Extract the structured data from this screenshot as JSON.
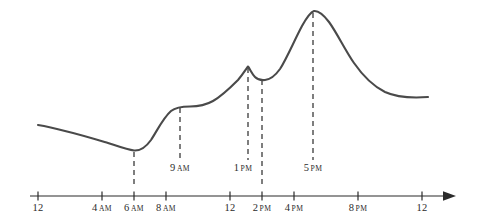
{
  "chart_data": {
    "type": "line",
    "title": "",
    "subtitle": "",
    "xlabel": "",
    "ylabel": "",
    "grid": false,
    "legend": "none",
    "x_axis": {
      "type": "time-of-day",
      "range_hours": [
        0,
        24
      ],
      "arrow_end": true,
      "tick_labels": [
        "12",
        "4 AM",
        "6 AM",
        "8 AM",
        "12",
        "2 PM",
        "4 PM",
        "8 PM",
        "12"
      ],
      "tick_hours": [
        0,
        4,
        6,
        8,
        12,
        14,
        16,
        20,
        24
      ]
    },
    "y_axis": {
      "visible": false,
      "ylim": [
        0,
        100
      ]
    },
    "markers": [
      {
        "label": "",
        "hour": 6,
        "labelled": false
      },
      {
        "label": "9 AM",
        "hour": 9,
        "labelled": true
      },
      {
        "label": "1 PM",
        "hour": 13,
        "labelled": true
      },
      {
        "label": "",
        "hour": 14,
        "labelled": false
      },
      {
        "label": "5 PM",
        "hour": 17,
        "labelled": true
      }
    ],
    "series": [
      {
        "name": "value",
        "x_hours": [
          0.0,
          1.5,
          3.0,
          4.5,
          6.0,
          6.8,
          7.6,
          8.4,
          9.0,
          10.0,
          11.0,
          12.0,
          12.6,
          13.0,
          13.5,
          14.0,
          14.6,
          15.4,
          16.2,
          17.0,
          18.0,
          19.2,
          20.6,
          22.0,
          23.4,
          24.4
        ],
        "values": [
          23,
          20,
          17,
          15,
          13,
          16,
          26,
          34,
          36,
          37,
          40,
          47,
          57,
          69,
          62,
          60,
          61,
          72,
          88,
          96,
          93,
          83,
          68,
          55,
          48,
          45
        ]
      }
    ]
  },
  "geometry": {
    "axis_y": 196,
    "axis_x_start": 30,
    "axis_x_end": 455,
    "x_for_hour_0": 38,
    "px_per_hour": 16,
    "curve_color": "#4a4a4a",
    "axis_color": "#2b2b2b",
    "dash_color": "#3a3a3a",
    "background": "#ffffff",
    "curve_path": "M 38 125 C 62 129, 88 137, 108 143 C 120 147, 128 150, 134 150.5 C 140 151, 146 147, 151 140 C 157 131, 163 118, 171 111 C 176 107, 182 106.5, 190 106.5 C 198 106.5, 206 105, 213 101 C 222 96, 230 88, 238 80 C 243 74, 246 69, 248 66.5 C 250 69, 252 74, 255 77 C 258 80, 261 80.5, 265 80 C 270 79.5, 275 76, 280 69 C 287 58, 294 41, 302 26 C 307 17, 311 12, 314 11 C 318 10.5, 323 14, 329 22 C 337 33, 345 50, 354 63 C 363 76, 373 86, 385 92 C 398 98, 414 98, 428 97",
    "marker_lines": [
      {
        "x": 134,
        "y_top": 152,
        "y_bottom": 186
      },
      {
        "x": 180,
        "y_top": 108,
        "y_bottom": 160
      },
      {
        "x": 248,
        "y_top": 68,
        "y_bottom": 160
      },
      {
        "x": 262,
        "y_top": 80,
        "y_bottom": 186
      },
      {
        "x": 313,
        "y_top": 13,
        "y_bottom": 160
      }
    ],
    "ticks": [
      {
        "x": 38,
        "label": "12",
        "meridiem": ""
      },
      {
        "x": 102,
        "label": "4",
        "meridiem": "AM"
      },
      {
        "x": 134,
        "label": "6",
        "meridiem": "AM"
      },
      {
        "x": 166,
        "label": "8",
        "meridiem": "AM"
      },
      {
        "x": 230,
        "label": "12",
        "meridiem": ""
      },
      {
        "x": 262,
        "label": "2",
        "meridiem": "PM"
      },
      {
        "x": 294,
        "label": "4",
        "meridiem": "PM"
      },
      {
        "x": 358,
        "label": "8",
        "meridiem": "PM"
      },
      {
        "x": 422,
        "label": "12",
        "meridiem": ""
      }
    ],
    "annotations": [
      {
        "x": 180,
        "y": 162,
        "label": "9",
        "meridiem": "AM"
      },
      {
        "x": 243,
        "y": 162,
        "label": "1",
        "meridiem": "PM"
      },
      {
        "x": 313,
        "y": 162,
        "label": "5",
        "meridiem": "PM"
      }
    ]
  }
}
